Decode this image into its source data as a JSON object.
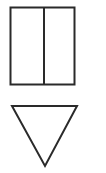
{
  "diagram": {
    "stroke_color": "#2a2a2a",
    "background": "#ffffff",
    "shapes": [
      {
        "type": "rectangle",
        "label": "",
        "x": 10,
        "y": 7,
        "width": 65,
        "height": 78,
        "divider_x": 44
      },
      {
        "type": "triangle-down",
        "label": "",
        "points": [
          [
            12,
            21
          ],
          [
            77,
            21
          ],
          [
            45,
            81
          ]
        ]
      }
    ]
  }
}
